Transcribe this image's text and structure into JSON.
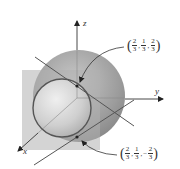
{
  "axes": {
    "x_label": "x",
    "y_label": "y",
    "z_label": "z"
  },
  "points": [
    {
      "name": "upper-intersection",
      "coords": [
        {
          "sign": "",
          "num": "2",
          "den": "3"
        },
        {
          "sign": "",
          "num": "1",
          "den": "3"
        },
        {
          "sign": "",
          "num": "2",
          "den": "3"
        }
      ]
    },
    {
      "name": "lower-intersection",
      "coords": [
        {
          "sign": "",
          "num": "2",
          "den": "3"
        },
        {
          "sign": "",
          "num": "1",
          "den": "3"
        },
        {
          "sign": "−",
          "num": "2",
          "den": "3"
        }
      ]
    }
  ],
  "colors": {
    "sphere": "#9a9a9a",
    "plane": "#b5b5b5",
    "circle": "#555555",
    "lines": "#666666",
    "axes": "#444444"
  }
}
